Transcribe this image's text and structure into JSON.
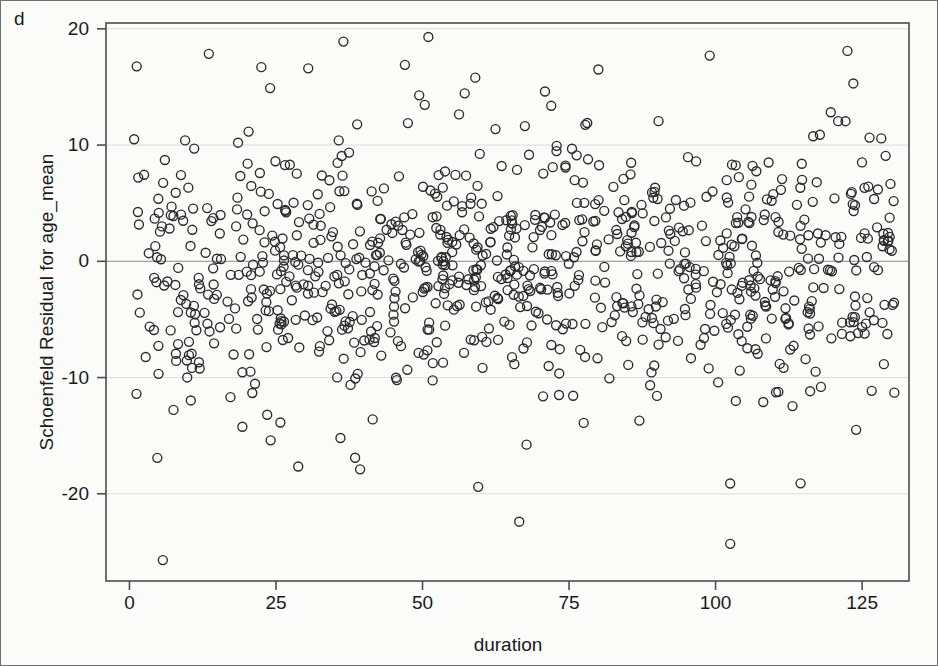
{
  "figure": {
    "corner_label": "d",
    "watermark_text": ""
  },
  "chart_data": {
    "type": "scatter",
    "title": "",
    "subtitle": "",
    "xlabel": "duration",
    "ylabel": "Schoenfeld Residual for age_mean",
    "xlim": [
      -4,
      133
    ],
    "ylim": [
      -27.5,
      20.5
    ],
    "xticks": [
      0,
      25,
      50,
      75,
      100,
      125
    ],
    "xticklabels": [
      "0",
      "25",
      "50",
      "75",
      "100",
      "125"
    ],
    "yticks": [
      20,
      10,
      0,
      -10,
      -20
    ],
    "yticklabels": [
      "20",
      "10",
      "0",
      "-10",
      "-20"
    ],
    "grid": true,
    "grid_axis": "y",
    "grid_color": "#d9d9d9",
    "zero_line": 0,
    "zero_line_color": "#8a8a8a",
    "legend": false,
    "marker": "open-circle",
    "marker_size": 9,
    "marker_color": "#2b2b2b",
    "marker_fill": "none",
    "panel_background": "#ffffff",
    "panel_border_color": "#4d4d4d",
    "n_points": 905,
    "series": [
      {
        "name": "Schoenfeld residuals",
        "x_range": [
          0.5,
          131
        ],
        "y_center": -0.8,
        "y_spread": 5.2,
        "notable_points": [
          {
            "x": 0.8,
            "y": 10.5
          },
          {
            "x": 1.5,
            "y": 7.2
          },
          {
            "x": 1.2,
            "y": -11.4
          },
          {
            "x": 5.7,
            "y": -25.7
          },
          {
            "x": 9.5,
            "y": 10.4
          },
          {
            "x": 22.5,
            "y": 16.7
          },
          {
            "x": 24.0,
            "y": 14.9
          },
          {
            "x": 23.5,
            "y": -13.2
          },
          {
            "x": 30.5,
            "y": 16.6
          },
          {
            "x": 36.5,
            "y": 18.9
          },
          {
            "x": 36.0,
            "y": -15.2
          },
          {
            "x": 38.5,
            "y": -16.9
          },
          {
            "x": 41.5,
            "y": -13.6
          },
          {
            "x": 47.0,
            "y": 16.9
          },
          {
            "x": 51.0,
            "y": 19.3
          },
          {
            "x": 59.5,
            "y": -19.4
          },
          {
            "x": 59.0,
            "y": 15.8
          },
          {
            "x": 66.5,
            "y": -22.4
          },
          {
            "x": 77.5,
            "y": -13.9
          },
          {
            "x": 80.0,
            "y": 16.5
          },
          {
            "x": 87.0,
            "y": -13.7
          },
          {
            "x": 99.0,
            "y": 17.7
          },
          {
            "x": 102.5,
            "y": -24.3
          },
          {
            "x": 114.5,
            "y": -19.1
          },
          {
            "x": 122.5,
            "y": 18.1
          },
          {
            "x": 123.5,
            "y": 15.3
          },
          {
            "x": 130.5,
            "y": -11.3
          }
        ]
      }
    ]
  }
}
